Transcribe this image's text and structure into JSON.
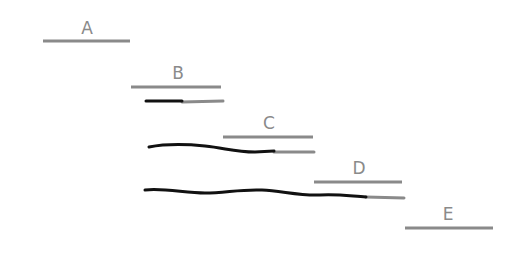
{
  "colors": {
    "bar": "#8a8a8a",
    "progress": "#111111",
    "background": "#ffffff"
  },
  "segments": [
    {
      "label": "A",
      "x1": 43,
      "x2": 130,
      "y": 41,
      "label_x": 87,
      "label_y": 34
    },
    {
      "label": "B",
      "x1": 131,
      "x2": 221,
      "y": 87,
      "label_x": 178,
      "label_y": 79
    },
    {
      "label": "C",
      "x1": 223,
      "x2": 313,
      "y": 137,
      "label_x": 269,
      "label_y": 129
    },
    {
      "label": "D",
      "x1": 314,
      "x2": 402,
      "y": 182,
      "label_x": 359,
      "label_y": 174
    },
    {
      "label": "E",
      "x1": 405,
      "x2": 493,
      "y": 228,
      "label_x": 448,
      "label_y": 220
    }
  ],
  "tracks": [
    {
      "name": "track-under-B",
      "black_path": "M146,101 L182,101",
      "gray_path": "M182,102 L223,101"
    },
    {
      "name": "track-under-C",
      "black_path": "M149,147 C165,144 185,144 205,146 C225,148 235,152 255,152 L274,151",
      "gray_path": "M274,152 L314,152"
    },
    {
      "name": "track-under-D",
      "black_path": "M145,190 C165,188 185,193 205,193 C225,193 240,189 262,190 C282,191 300,196 320,195 C338,194 350,196 366,197",
      "gray_path": "M366,197 L404,198"
    }
  ]
}
